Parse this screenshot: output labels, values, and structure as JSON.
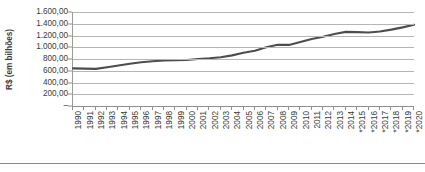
{
  "chart_data": {
    "type": "line",
    "title": "",
    "subtitle": "",
    "xlabel": "",
    "ylabel": "R$ (em bilhões)",
    "grid": true,
    "legend": "none",
    "xlim": [
      1990,
      2020
    ],
    "ylim": [
      0,
      1600
    ],
    "y_ticks": [
      0,
      200,
      400,
      600,
      800,
      1000,
      1200,
      1400,
      1600
    ],
    "y_tick_labels": [
      "–",
      "200,00",
      "400,00",
      "600,00",
      "800,00",
      "1.000,00",
      "1.200,00",
      "1.400,00",
      "1.600,00"
    ],
    "categories": [
      "1990",
      "1991",
      "1992",
      "1993",
      "1994",
      "1995",
      "1996",
      "1997",
      "1998",
      "1999",
      "2000",
      "2001",
      "2002",
      "2003",
      "2004",
      "2005",
      "2006",
      "2007",
      "2008",
      "2009",
      "2010",
      "2011",
      "2012",
      "2013",
      "2014",
      "*2015",
      "*2016",
      "*2017",
      "*2018",
      "*2019",
      "*2020"
    ],
    "values": [
      640,
      637,
      632,
      660,
      690,
      718,
      745,
      762,
      775,
      780,
      782,
      800,
      812,
      830,
      862,
      905,
      940,
      1000,
      1042,
      1040,
      1090,
      1140,
      1180,
      1225,
      1262,
      1258,
      1252,
      1268,
      1300,
      1338,
      1382
    ],
    "series": [
      {
        "name": "R$ (em bilhões)",
        "color": "#4d4d4d",
        "values": [
          640,
          637,
          632,
          660,
          690,
          718,
          745,
          762,
          775,
          780,
          782,
          800,
          812,
          830,
          862,
          905,
          940,
          1000,
          1042,
          1040,
          1090,
          1140,
          1180,
          1225,
          1262,
          1258,
          1252,
          1268,
          1300,
          1338,
          1382
        ]
      }
    ],
    "note": "Anos marcados com asterisco (*) indicam projeção."
  },
  "style": {
    "line_color": "#4d4d4d",
    "grid_color": "#b5b5b5",
    "axis_color": "#8f8f8f",
    "text_color": "#3a3a3a",
    "background": "#ffffff"
  }
}
